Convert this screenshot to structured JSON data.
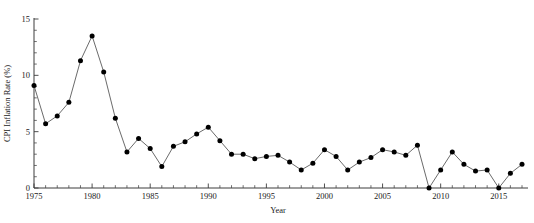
{
  "chart_data": {
    "type": "line",
    "title": "",
    "subtitle": "",
    "xlabel": "Year",
    "ylabel": "CPI Inflation Rate (%)",
    "xlim": [
      1975,
      2017
    ],
    "ylim": [
      0,
      15
    ],
    "grid": false,
    "legend": null,
    "x_tick_labels": [
      "1975",
      "1980",
      "1985",
      "1990",
      "1995",
      "2000",
      "2005",
      "2010",
      "2015"
    ],
    "x_tick_values": [
      1975,
      1980,
      1985,
      1990,
      1995,
      2000,
      2005,
      2010,
      2015
    ],
    "x_minor_tick_step": 1,
    "y_tick_labels": [
      "0",
      "5",
      "10",
      "15"
    ],
    "y_tick_values": [
      0,
      5,
      10,
      15
    ],
    "y_minor_tick_step": 1,
    "marker": "filled-circle",
    "line_color": "#6b6b6b",
    "marker_color": "#000000",
    "x": [
      1975,
      1976,
      1977,
      1978,
      1979,
      1980,
      1981,
      1982,
      1983,
      1984,
      1985,
      1986,
      1987,
      1988,
      1989,
      1990,
      1991,
      1992,
      1993,
      1994,
      1995,
      1996,
      1997,
      1998,
      1999,
      2000,
      2001,
      2002,
      2003,
      2004,
      2005,
      2006,
      2007,
      2008,
      2009,
      2010,
      2011,
      2012,
      2013,
      2014,
      2015,
      2016,
      2017
    ],
    "values": [
      9.1,
      5.7,
      6.4,
      7.6,
      11.3,
      13.5,
      10.3,
      6.2,
      3.2,
      4.4,
      3.5,
      1.9,
      3.7,
      4.1,
      4.8,
      5.4,
      4.2,
      3.0,
      3.0,
      2.6,
      2.8,
      2.9,
      2.3,
      1.6,
      2.2,
      3.4,
      2.8,
      1.6,
      2.3,
      2.7,
      3.4,
      3.2,
      2.9,
      3.8,
      0.0,
      1.6,
      3.2,
      2.1,
      1.5,
      1.6,
      0.0,
      1.3,
      2.1
    ]
  }
}
